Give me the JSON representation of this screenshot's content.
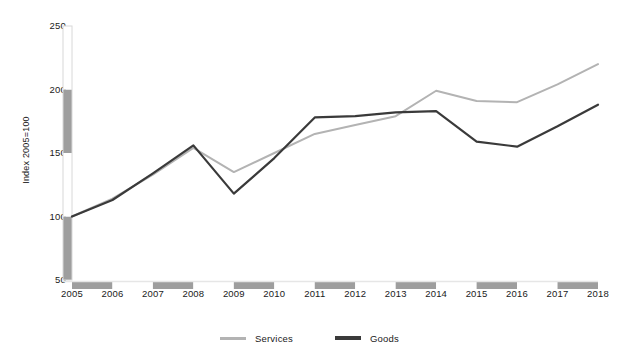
{
  "chart_data": {
    "type": "line",
    "title": "",
    "subtitle": "",
    "xlabel": "",
    "ylabel": "Index 2005=100",
    "categories": [
      "2005",
      "2006",
      "2007",
      "2008",
      "2009",
      "2010",
      "2011",
      "2012",
      "2013",
      "2014",
      "2015",
      "2016",
      "2017",
      "2018"
    ],
    "x": [
      2005,
      2006,
      2007,
      2008,
      2009,
      2010,
      2011,
      2012,
      2013,
      2014,
      2015,
      2016,
      2017,
      2018
    ],
    "xlim": [
      2005,
      2018
    ],
    "ylim": [
      50,
      250
    ],
    "yticks": [
      50,
      100,
      150,
      200,
      250
    ],
    "xticks": [
      "2005",
      "2006",
      "2007",
      "2008",
      "2009",
      "2010",
      "2011",
      "2012",
      "2013",
      "2014",
      "2015",
      "2016",
      "2017",
      "2018"
    ],
    "grid": false,
    "legend_position": "bottom",
    "series": [
      {
        "name": "Services",
        "color": "#b3b3b3",
        "values": [
          100,
          114,
          133,
          154,
          135,
          150,
          165,
          172,
          179,
          199,
          191,
          190,
          204,
          220
        ]
      },
      {
        "name": "Goods",
        "color": "#3a3a3a",
        "values": [
          100,
          113,
          134,
          156,
          118,
          146,
          178,
          179,
          182,
          183,
          159,
          155,
          171,
          188
        ]
      }
    ]
  },
  "axis": {
    "y_title": "Index 2005=100",
    "y_tick_labels": [
      "250",
      "200",
      "150",
      "100",
      "50"
    ],
    "x_tick_labels": [
      "2005",
      "2006",
      "2007",
      "2008",
      "2009",
      "2010",
      "2011",
      "2012",
      "2013",
      "2014",
      "2015",
      "2016",
      "2017",
      "2018"
    ]
  },
  "legend": {
    "items": [
      {
        "label": "Services",
        "color": "#b3b3b3"
      },
      {
        "label": "Goods",
        "color": "#3a3a3a"
      }
    ]
  },
  "colors": {
    "services": "#b3b3b3",
    "goods": "#3a3a3a",
    "axis_band": "#9e9e9e",
    "axis_band_alt": "#ffffff",
    "text": "#1a1a1a",
    "background": "#ffffff"
  }
}
